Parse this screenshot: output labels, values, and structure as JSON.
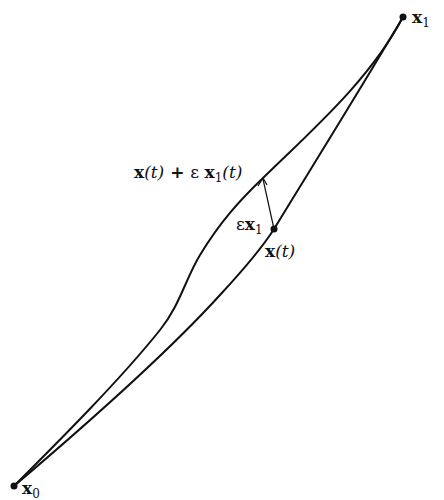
{
  "figure": {
    "colors": {
      "stroke": "#111111",
      "background": "#ffffff"
    },
    "points": {
      "x0": {
        "label_main": "x",
        "label_sub": "0"
      },
      "x1": {
        "label_main": "x",
        "label_sub": "1"
      },
      "xt": {
        "label_main": "x",
        "label_arg": "(t)"
      }
    },
    "perturbed_label": {
      "part1_main": "x",
      "part1_arg": "(t)",
      "plus": " + ",
      "eps": "ε ",
      "part2_main": "x",
      "part2_sub": "1",
      "part2_arg": "(t)"
    },
    "arrow_label": {
      "eps": "ε",
      "main": "x",
      "sub": "1"
    }
  }
}
